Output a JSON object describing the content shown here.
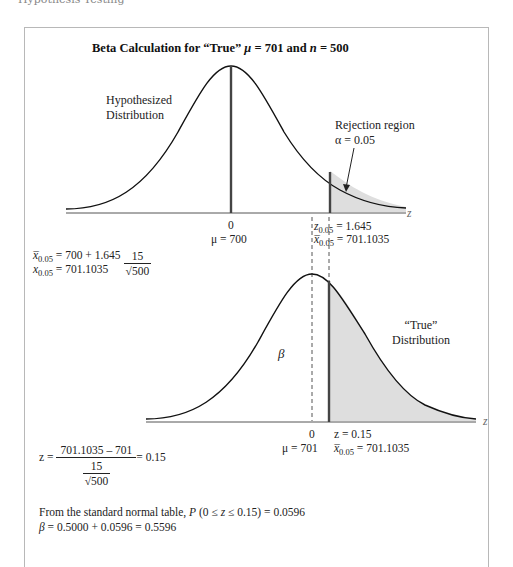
{
  "header": {
    "cut_text": "Hypothesis Testing"
  },
  "figure": {
    "title_prefix": "Beta Calculation for “True” ",
    "title_mu": "μ",
    "title_mid": " = 701 and ",
    "title_n": "n",
    "title_suffix": " = 500",
    "upper": {
      "label_line1": "Hypothesized",
      "label_line2": "Distribution",
      "rejection_line1": "Rejection region",
      "rejection_alpha": "α = 0.05",
      "axis_label": "z",
      "tick_zero": "0",
      "tick_mu": "μ = 700",
      "z_crit_label": "z",
      "z_crit_sub": "0.05",
      "z_crit_value": " = 1.645",
      "x_crit_label": "x̅",
      "x_crit_sub": "0.05",
      "x_crit_value": " = 701.1035"
    },
    "calc1": {
      "line1_lhs": "x̅",
      "line1_sub": "0.05",
      "line1_rhs": " = 700 + 1.645",
      "frac_num": "15",
      "frac_den": "√500",
      "line2_lhs": "x",
      "line2_sub": "0.05",
      "line2_rhs": " = 701.1035"
    },
    "lower": {
      "true_label_line1": "“True”",
      "true_label_line2": "Distribution",
      "beta_label": "β",
      "axis_label": "z",
      "tick_zero": "0",
      "tick_mu": "μ = 701",
      "z_value": "z = 0.15",
      "x_crit_label": "x̅",
      "x_crit_sub": "0.05",
      "x_crit_value": " = 701.1035"
    },
    "calc2": {
      "lhs": "z = ",
      "num": "701.1035 – 701",
      "den_num": "15",
      "den_den": "√500",
      "rhs": " = 0.15"
    },
    "conclusion": {
      "line1_prefix": "From the standard normal table, ",
      "line1_P": "P",
      "line1_expr": " (0 ≤ ",
      "line1_z": "z",
      "line1_rest": " ≤ 0.15) = 0.0596",
      "line2_beta": "β",
      "line2_rest": " = 0.5000 + 0.0596 = 0.5596"
    }
  },
  "colors": {
    "shade": "#dedede",
    "curve": "#111111",
    "mean_line": "#444444",
    "frame": "#b8b8b8"
  }
}
